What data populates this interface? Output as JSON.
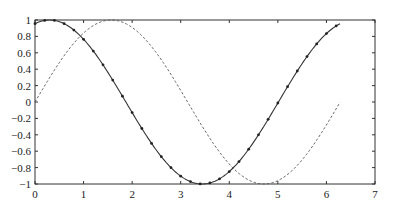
{
  "chart_data": {
    "type": "line",
    "title": "",
    "xlabel": "",
    "ylabel": "",
    "xlim": [
      0,
      7
    ],
    "ylim": [
      -1,
      1
    ],
    "xticks": [
      0,
      1,
      2,
      3,
      4,
      5,
      6,
      7
    ],
    "yticks": [
      -1,
      -0.8,
      -0.6,
      -0.4,
      -0.2,
      0,
      0.2,
      0.4,
      0.6,
      0.8,
      1
    ],
    "xtick_labels": [
      "0",
      "1",
      "2",
      "3",
      "4",
      "5",
      "6",
      "7"
    ],
    "ytick_labels": [
      "−1",
      "−0.8",
      "−0.6",
      "−0.4",
      "−0.2",
      "0",
      "0.2",
      "0.4",
      "0.6",
      "0.8",
      "1"
    ],
    "grid": false,
    "legend": null,
    "series": [
      {
        "name": "cos(x - 0.3)",
        "style": "solid",
        "marker": "dot",
        "color": "#333333",
        "x_range": [
          0,
          6.28
        ],
        "description": "phase-shifted cosine, starts ~0.95, max 1 at x≈0.3, min -1 at x≈3.44, ends ~0.95",
        "x": [
          0,
          0.5,
          1,
          1.5,
          2,
          2.5,
          3,
          3.44,
          4,
          4.5,
          5,
          5.5,
          6,
          6.28
        ],
        "y": [
          0.96,
          0.98,
          0.76,
          0.36,
          -0.13,
          -0.59,
          -0.9,
          -1.0,
          -0.85,
          -0.47,
          0.02,
          0.5,
          0.86,
          0.95
        ]
      },
      {
        "name": "sin(x)",
        "style": "dashed",
        "marker": "none",
        "color": "#555555",
        "x_range": [
          0,
          6.28
        ],
        "x": [
          0,
          0.5,
          1,
          1.57,
          2,
          2.5,
          3,
          3.5,
          4,
          4.71,
          5,
          5.5,
          6,
          6.28
        ],
        "y": [
          0,
          0.48,
          0.84,
          1.0,
          0.91,
          0.6,
          0.14,
          -0.35,
          -0.76,
          -1.0,
          -0.96,
          -0.71,
          -0.28,
          0
        ]
      }
    ]
  }
}
